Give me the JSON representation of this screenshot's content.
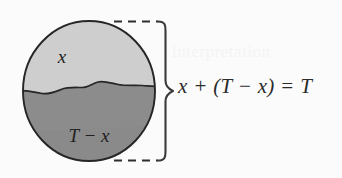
{
  "figure": {
    "kind": "venn-partition-diagram",
    "background_color": "#fbfbfb",
    "upper_region_fill": "#cecece",
    "lower_region_fill": "#8c8c8c",
    "outline_color": "#262626",
    "brace_color": "#3a3a3a",
    "dash_color": "#2e2e2e",
    "labels": {
      "upper": "x",
      "lower": "T − x"
    },
    "brace": {
      "equation": "x + (T − x) = T",
      "top_dash_label": "",
      "bottom_dash_label": ""
    },
    "artifact_text": "interpretation"
  }
}
